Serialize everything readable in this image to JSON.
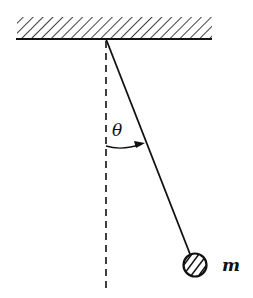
{
  "diagram": {
    "labels": {
      "angle": "θ",
      "mass": "m"
    },
    "elements": {
      "ceiling": "hatched fixed support",
      "string": "massless rod from pivot to bob",
      "bob": "hatched circular mass",
      "vertical_reference": "dashed vertical line",
      "angle_arc": "arc with arrow from vertical to string"
    },
    "colors": {
      "ink": "#111111",
      "background": "#ffffff"
    }
  }
}
